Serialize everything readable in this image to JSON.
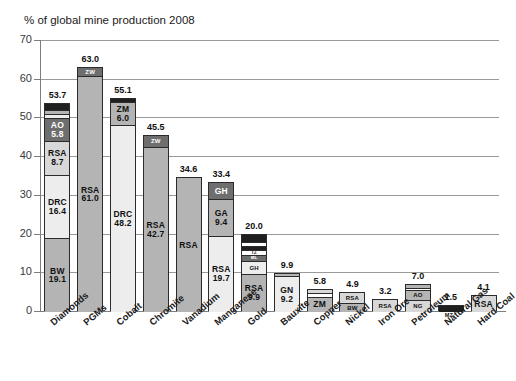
{
  "chart_data": {
    "type": "bar",
    "title": "% of global mine production 2008",
    "xlabel": "",
    "ylabel": "% of global mine production 2008",
    "ylim": [
      0,
      70
    ],
    "yticks": [
      0,
      10,
      20,
      30,
      40,
      50,
      60,
      70
    ],
    "grid": true,
    "legend": "none",
    "stacked": true,
    "categories": [
      "Diamonds",
      "PGMs",
      "Cobalt",
      "Chromite",
      "Vanadium",
      "Manganese",
      "Gold",
      "Bauxite",
      "Copper",
      "Nickel",
      "Iron Ore",
      "Petroleum",
      "Natural Gas",
      "Hard Coal"
    ],
    "totals": [
      53.7,
      63.0,
      55.1,
      45.5,
      34.6,
      33.4,
      20.0,
      9.9,
      5.8,
      4.9,
      3.2,
      7.0,
      1.5,
      4.1
    ],
    "bars": [
      {
        "category": "Diamonds",
        "total": "53.7",
        "segments": [
          {
            "code": "BW",
            "value": "19.1",
            "size": 19.1,
            "shade": "mid"
          },
          {
            "code": "DRC",
            "value": "16.4",
            "size": 16.4,
            "shade": "pale"
          },
          {
            "code": "RSA",
            "value": "8.7",
            "size": 8.7,
            "shade": "light"
          },
          {
            "code": "AO",
            "value": "5.8",
            "size": 5.8,
            "shade": "dark"
          },
          {
            "code": "",
            "value": "",
            "size": 1.2,
            "shade": "pale"
          },
          {
            "code": "",
            "value": "",
            "size": 0.9,
            "shade": "mid"
          },
          {
            "code": "",
            "value": "",
            "size": 1.6,
            "shade": "darkest"
          }
        ]
      },
      {
        "category": "PGMs",
        "total": "63.0",
        "segments": [
          {
            "code": "RSA",
            "value": "61.0",
            "size": 61.0,
            "shade": "mid"
          },
          {
            "code": "ZW",
            "value": "",
            "size": 2.0,
            "shade": "dark"
          }
        ]
      },
      {
        "category": "Cobalt",
        "total": "55.1",
        "segments": [
          {
            "code": "DRC",
            "value": "48.2",
            "size": 48.2,
            "shade": "pale"
          },
          {
            "code": "ZM",
            "value": "6.0",
            "size": 6.0,
            "shade": "mid"
          },
          {
            "code": "",
            "value": "",
            "size": 0.9,
            "shade": "darkest"
          }
        ]
      },
      {
        "category": "Chromite",
        "total": "45.5",
        "segments": [
          {
            "code": "RSA",
            "value": "42.7",
            "size": 42.7,
            "shade": "mid"
          },
          {
            "code": "ZW",
            "value": "",
            "size": 2.8,
            "shade": "dark"
          }
        ]
      },
      {
        "category": "Vanadium",
        "total": "34.6",
        "segments": [
          {
            "code": "RSA",
            "value": "",
            "size": 34.6,
            "shade": "mid"
          }
        ]
      },
      {
        "category": "Manganese",
        "total": "33.4",
        "segments": [
          {
            "code": "RSA",
            "value": "19.7",
            "size": 19.7,
            "shade": "pale"
          },
          {
            "code": "GA",
            "value": "9.4",
            "size": 9.4,
            "shade": "mid"
          },
          {
            "code": "GH",
            "value": "",
            "size": 4.3,
            "shade": "dark"
          }
        ]
      },
      {
        "category": "Gold",
        "total": "20.0",
        "segments": [
          {
            "code": "RSA",
            "value": "9.9",
            "size": 9.9,
            "shade": "mid"
          },
          {
            "code": "GH",
            "value": "",
            "size": 3.2,
            "shade": "pale"
          },
          {
            "code": "ML",
            "value": "",
            "size": 1.5,
            "shade": "dark"
          },
          {
            "code": "TZ",
            "value": "",
            "size": 1.4,
            "shade": "white"
          },
          {
            "code": "",
            "value": "",
            "size": 1.1,
            "shade": "darkest"
          },
          {
            "code": "",
            "value": "",
            "size": 1.0,
            "shade": "white"
          },
          {
            "code": "",
            "value": "",
            "size": 1.9,
            "shade": "darkest"
          }
        ]
      },
      {
        "category": "Bauxite",
        "total": "9.9",
        "segments": [
          {
            "code": "GN",
            "value": "9.2",
            "size": 9.2,
            "shade": "pale"
          },
          {
            "code": "",
            "value": "",
            "size": 0.7,
            "shade": "mid"
          }
        ]
      },
      {
        "category": "Copper",
        "total": "5.8",
        "segments": [
          {
            "code": "ZM",
            "value": "",
            "size": 4.0,
            "shade": "mid"
          },
          {
            "code": "",
            "value": "",
            "size": 1.0,
            "shade": "white"
          },
          {
            "code": "",
            "value": "",
            "size": 0.8,
            "shade": "light"
          }
        ]
      },
      {
        "category": "Nickel",
        "total": "4.9",
        "segments": [
          {
            "code": "BW",
            "value": "",
            "size": 2.3,
            "shade": "mid"
          },
          {
            "code": "RSA",
            "value": "",
            "size": 2.6,
            "shade": "light"
          }
        ]
      },
      {
        "category": "Iron Ore",
        "total": "3.2",
        "segments": [
          {
            "code": "RSA",
            "value": "",
            "size": 3.2,
            "shade": "light"
          }
        ]
      },
      {
        "category": "Petroleum",
        "total": "7.0",
        "segments": [
          {
            "code": "NG",
            "value": "",
            "size": 3.2,
            "shade": "light"
          },
          {
            "code": "AO",
            "value": "",
            "size": 2.5,
            "shade": "mid"
          },
          {
            "code": "",
            "value": "",
            "size": 0.6,
            "shade": "white"
          },
          {
            "code": "",
            "value": "",
            "size": 0.7,
            "shade": "mid"
          }
        ]
      },
      {
        "category": "Natural Gas",
        "total": "1.5",
        "outer_code": "MZ",
        "segments": [
          {
            "code": "",
            "value": "",
            "size": 1.5,
            "shade": "darkest"
          }
        ]
      },
      {
        "category": "Hard Coal",
        "total": "4.1",
        "segments": [
          {
            "code": "RSA",
            "value": "",
            "size": 4.1,
            "shade": "light"
          }
        ]
      }
    ],
    "colors": {
      "white": "#ffffff",
      "pale": "#ededed",
      "light": "#d8d8d8",
      "mid": "#b4b4b4",
      "dark": "#6e6e6e",
      "darkest": "#1f1f1f",
      "axis": "#7d7d7d",
      "grid": "#9a9a9a",
      "text": "#111111"
    }
  }
}
